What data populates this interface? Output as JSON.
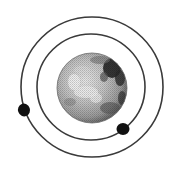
{
  "diagram": {
    "background": "#ffffff",
    "planet": {
      "name": "planet",
      "cx": 92,
      "cy": 88,
      "r": 35,
      "base_color": "#b8b8b8",
      "light_color": "#e6e6e6",
      "dark_color": "#2a2a2a"
    },
    "orbits": [
      {
        "name": "inner-orbit",
        "cx": 91,
        "cy": 87,
        "rx": 54,
        "ry": 53,
        "stroke": "#3a3a3a",
        "width": 1.6
      },
      {
        "name": "outer-orbit",
        "cx": 92,
        "cy": 87,
        "rx": 71,
        "ry": 70,
        "stroke": "#3a3a3a",
        "width": 1.6
      }
    ],
    "moons": [
      {
        "name": "outer-moon",
        "orbit": "outer-orbit",
        "cx": 24,
        "cy": 110,
        "rx": 6,
        "ry": 6.5,
        "color": "#111111"
      },
      {
        "name": "inner-moon",
        "orbit": "inner-orbit",
        "cx": 123,
        "cy": 129,
        "rx": 6.5,
        "ry": 6,
        "color": "#111111"
      }
    ]
  }
}
